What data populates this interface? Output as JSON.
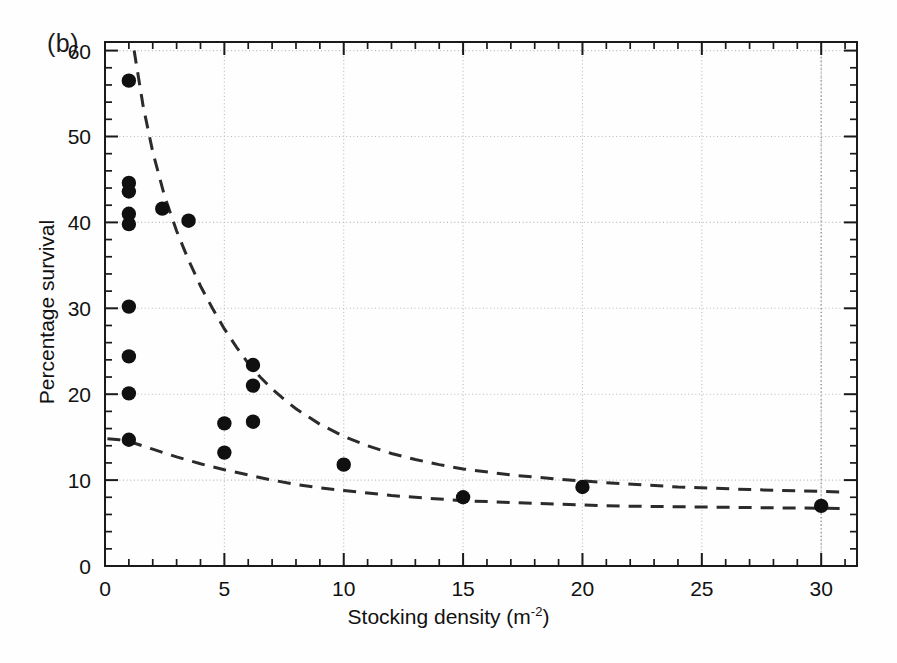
{
  "figure": {
    "panel_label": "(b)",
    "background_color": "#fefefe",
    "marker_color": "#101010",
    "curve_color": "#2b2b2b",
    "axis_color": "#1a1a1a",
    "grid_color": "#b9b9b9"
  },
  "chart_data": {
    "type": "scatter",
    "title": "",
    "subtitle": "",
    "panel": "(b)",
    "xlabel": "Stocking density (m-2)",
    "xlabel_base": "Stocking density (m",
    "xlabel_sup": "-2",
    "xlabel_close": ")",
    "ylabel": "Percentage survival",
    "xlim": [
      0,
      31.5
    ],
    "ylim": [
      0,
      61
    ],
    "xticks": [
      0,
      5,
      10,
      15,
      20,
      25,
      30
    ],
    "xtick_labels": [
      "0",
      "5",
      "10",
      "15",
      "20",
      "25",
      "30"
    ],
    "xminor_step": 1,
    "yticks": [
      0,
      10,
      20,
      30,
      40,
      50,
      60
    ],
    "ytick_labels": [
      "0",
      "10",
      "20",
      "30",
      "40",
      "50",
      "60"
    ],
    "yminor_step": 2,
    "grid": "dotted-major-both",
    "legend": "none",
    "points": [
      {
        "x": 1.0,
        "y": 56.5
      },
      {
        "x": 1.0,
        "y": 44.6
      },
      {
        "x": 1.0,
        "y": 43.6
      },
      {
        "x": 1.0,
        "y": 41.0
      },
      {
        "x": 1.0,
        "y": 39.8
      },
      {
        "x": 1.0,
        "y": 30.2
      },
      {
        "x": 1.0,
        "y": 24.4
      },
      {
        "x": 1.0,
        "y": 20.1
      },
      {
        "x": 1.0,
        "y": 14.7
      },
      {
        "x": 2.4,
        "y": 41.6
      },
      {
        "x": 3.5,
        "y": 40.2
      },
      {
        "x": 5.0,
        "y": 16.6
      },
      {
        "x": 5.0,
        "y": 13.2
      },
      {
        "x": 6.2,
        "y": 23.4
      },
      {
        "x": 6.2,
        "y": 21.0
      },
      {
        "x": 6.2,
        "y": 16.8
      },
      {
        "x": 10.0,
        "y": 11.8
      },
      {
        "x": 15.0,
        "y": 8.0
      },
      {
        "x": 20.0,
        "y": 9.2
      },
      {
        "x": 30.0,
        "y": 7.0
      }
    ],
    "curves": [
      {
        "name": "upper-fitted-decay-curve",
        "style": "dashed",
        "points": [
          {
            "x": 1.22,
            "y": 60.0
          },
          {
            "x": 1.6,
            "y": 53.5
          },
          {
            "x": 2.0,
            "y": 48.2
          },
          {
            "x": 2.5,
            "y": 43.0
          },
          {
            "x": 3.0,
            "y": 39.0
          },
          {
            "x": 3.5,
            "y": 35.6
          },
          {
            "x": 4.0,
            "y": 32.6
          },
          {
            "x": 4.5,
            "y": 30.0
          },
          {
            "x": 5.0,
            "y": 27.6
          },
          {
            "x": 5.5,
            "y": 25.5
          },
          {
            "x": 6.0,
            "y": 23.6
          },
          {
            "x": 6.5,
            "y": 22.0
          },
          {
            "x": 7.0,
            "y": 20.6
          },
          {
            "x": 7.5,
            "y": 19.4
          },
          {
            "x": 8.0,
            "y": 18.3
          },
          {
            "x": 9.0,
            "y": 16.5
          },
          {
            "x": 10.0,
            "y": 15.1
          },
          {
            "x": 11.0,
            "y": 14.0
          },
          {
            "x": 12.0,
            "y": 13.1
          },
          {
            "x": 13.0,
            "y": 12.4
          },
          {
            "x": 14.0,
            "y": 11.8
          },
          {
            "x": 15.0,
            "y": 11.3
          },
          {
            "x": 17.0,
            "y": 10.6
          },
          {
            "x": 19.0,
            "y": 10.1
          },
          {
            "x": 21.0,
            "y": 9.7
          },
          {
            "x": 24.0,
            "y": 9.2
          },
          {
            "x": 27.0,
            "y": 8.9
          },
          {
            "x": 31.0,
            "y": 8.6
          }
        ]
      },
      {
        "name": "lower-fitted-decay-curve",
        "style": "dashed",
        "points": [
          {
            "x": 0.1,
            "y": 14.8
          },
          {
            "x": 0.6,
            "y": 14.7
          },
          {
            "x": 1.0,
            "y": 14.5
          },
          {
            "x": 2.0,
            "y": 13.6
          },
          {
            "x": 3.0,
            "y": 12.7
          },
          {
            "x": 4.0,
            "y": 11.9
          },
          {
            "x": 5.0,
            "y": 11.2
          },
          {
            "x": 6.0,
            "y": 10.6
          },
          {
            "x": 7.0,
            "y": 10.0
          },
          {
            "x": 8.0,
            "y": 9.5
          },
          {
            "x": 9.0,
            "y": 9.1
          },
          {
            "x": 10.0,
            "y": 8.8
          },
          {
            "x": 11.0,
            "y": 8.5
          },
          {
            "x": 12.0,
            "y": 8.2
          },
          {
            "x": 13.0,
            "y": 8.0
          },
          {
            "x": 14.0,
            "y": 7.8
          },
          {
            "x": 15.0,
            "y": 7.6
          },
          {
            "x": 17.0,
            "y": 7.4
          },
          {
            "x": 19.0,
            "y": 7.2
          },
          {
            "x": 21.0,
            "y": 7.0
          },
          {
            "x": 24.0,
            "y": 6.9
          },
          {
            "x": 27.0,
            "y": 6.8
          },
          {
            "x": 31.0,
            "y": 6.7
          }
        ]
      }
    ]
  }
}
